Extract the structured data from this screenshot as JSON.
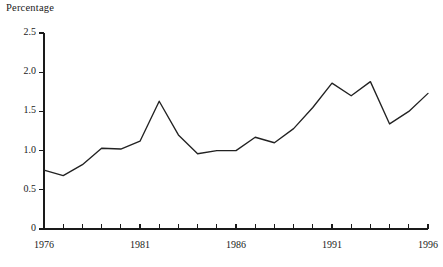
{
  "chart_data": {
    "type": "line",
    "title": "Percentage",
    "xlabel": "",
    "ylabel": "Percentage",
    "ylim": [
      0,
      2.5
    ],
    "xlim": [
      1976,
      1996
    ],
    "grid": false,
    "legend": "none",
    "y_ticks": [
      "0",
      "0.5",
      "1.0",
      "1.5",
      "2.0",
      "2.5"
    ],
    "y_tick_values": [
      0,
      0.5,
      1.0,
      1.5,
      2.0,
      2.5
    ],
    "x_ticks": [
      "1976",
      "1981",
      "1986",
      "1991",
      "1996"
    ],
    "x_tick_values": [
      1976,
      1981,
      1986,
      1991,
      1996
    ],
    "x_minor_tick_values": [
      1976,
      1977,
      1978,
      1979,
      1980,
      1981,
      1982,
      1983,
      1984,
      1985,
      1986,
      1987,
      1988,
      1989,
      1990,
      1991,
      1992,
      1993,
      1994,
      1995,
      1996
    ],
    "x": [
      1976,
      1977,
      1978,
      1979,
      1980,
      1981,
      1982,
      1983,
      1984,
      1985,
      1986,
      1987,
      1988,
      1989,
      1990,
      1991,
      1992,
      1993,
      1994,
      1995,
      1996
    ],
    "values": [
      0.75,
      0.68,
      0.82,
      1.03,
      1.02,
      1.12,
      1.63,
      1.2,
      0.96,
      1.0,
      1.0,
      1.17,
      1.1,
      1.28,
      1.55,
      1.86,
      1.7,
      1.88,
      1.34,
      1.5,
      1.73
    ],
    "series": [
      {
        "name": "Percentage",
        "color": "#222222",
        "values": [
          0.75,
          0.68,
          0.82,
          1.03,
          1.02,
          1.12,
          1.63,
          1.2,
          0.96,
          1.0,
          1.0,
          1.17,
          1.1,
          1.28,
          1.55,
          1.86,
          1.7,
          1.88,
          1.34,
          1.5,
          1.73
        ]
      }
    ]
  },
  "plot_geometry": {
    "left": 44,
    "right": 428,
    "top": 33,
    "bottom": 229
  }
}
